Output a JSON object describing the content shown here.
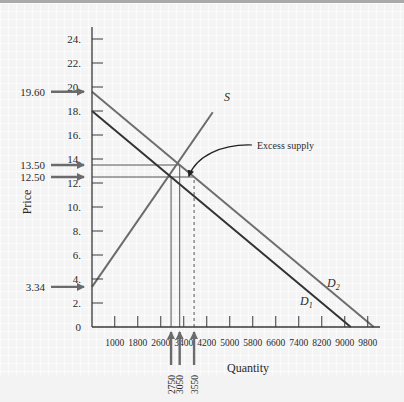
{
  "chart_data": {
    "type": "line",
    "title": "",
    "xlabel": "Quantity",
    "ylabel": "Price",
    "xlim": [
      0,
      10100
    ],
    "ylim": [
      0,
      25
    ],
    "grid": true,
    "x_ticks": [
      1000,
      1800,
      2600,
      3400,
      4200,
      5000,
      5800,
      6600,
      7400,
      8200,
      9000,
      9800
    ],
    "x_tick_labels": [
      "1000",
      "1800",
      "2600",
      "3400",
      "4200",
      "5000",
      "5800",
      "6600",
      "7400",
      "8200",
      "9000",
      "9800"
    ],
    "y_ticks": [
      0,
      2,
      4,
      6,
      8,
      10,
      12,
      14,
      16,
      18,
      20,
      22,
      24
    ],
    "y_tick_labels": [
      "0",
      "2.",
      "4.",
      "6.",
      "8.",
      "10.",
      "12.",
      "14.",
      "16.",
      "18.",
      "20.",
      "22.",
      "24."
    ],
    "series": [
      {
        "name": "S",
        "label": "S",
        "points": [
          [
            0,
            3.34
          ],
          [
            4200,
            17.9
          ]
        ]
      },
      {
        "name": "D1",
        "label": "D",
        "subscript": "1",
        "points": [
          [
            0,
            18
          ],
          [
            9000,
            0
          ]
        ]
      },
      {
        "name": "D2",
        "label": "D",
        "subscript": "2",
        "points": [
          [
            0,
            19.6
          ],
          [
            9800,
            0
          ]
        ]
      }
    ],
    "price_markers": [
      {
        "label": "19.60",
        "value": 19.6
      },
      {
        "label": "13.50",
        "value": 13.5
      },
      {
        "label": "12.50",
        "value": 12.5
      },
      {
        "label": "3.34",
        "value": 3.34
      }
    ],
    "quantity_markers": [
      {
        "label": "2750",
        "value": 2750
      },
      {
        "label": "3050",
        "value": 3050
      },
      {
        "label": "3550",
        "value": 3550,
        "dashed": true
      }
    ],
    "guide_lines": [
      {
        "from": [
          0,
          13.5
        ],
        "to": [
          3050,
          13.5
        ]
      },
      {
        "from": [
          0,
          12.5
        ],
        "to": [
          3550,
          12.5
        ]
      },
      {
        "from": [
          2750,
          0
        ],
        "to": [
          2750,
          12.5
        ]
      },
      {
        "from": [
          3050,
          0
        ],
        "to": [
          3050,
          13.5
        ]
      },
      {
        "from": [
          3550,
          0
        ],
        "to": [
          3550,
          12.5
        ],
        "dashed": true
      }
    ],
    "annotations": [
      {
        "text": "Excess supply",
        "points_to": [
          3300,
          12.9
        ]
      }
    ],
    "colors": {
      "supply": "#6b6b6b",
      "demand1": "#333333",
      "demand2": "#6e6e6e",
      "arrow": "#6b6b6b",
      "axis": "#3a3a3a"
    }
  }
}
